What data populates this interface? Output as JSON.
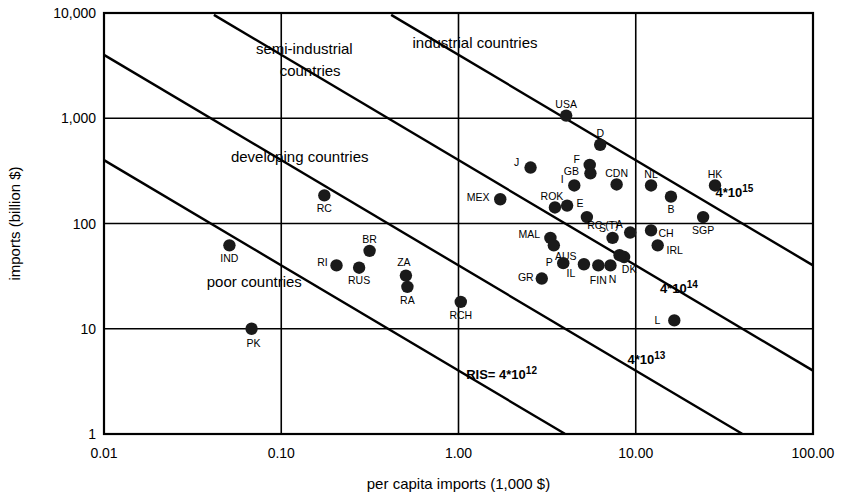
{
  "chart_data": {
    "type": "scatter",
    "title": "",
    "xlabel": "per capita imports (1,000 $)",
    "ylabel": "imports (billion $)",
    "xscale": "log",
    "yscale": "log",
    "xlim": [
      0.01,
      100.0
    ],
    "ylim": [
      1,
      10000
    ],
    "xticks": [
      "0.01",
      "0.10",
      "1.00",
      "10.00",
      "100.00"
    ],
    "xtick_values": [
      0.01,
      0.1,
      1.0,
      10.0,
      100.0
    ],
    "yticks": [
      "10,000",
      "1,000",
      "100",
      "10",
      "1"
    ],
    "ytick_values": [
      10000,
      1000,
      100,
      10,
      1
    ],
    "grid": true,
    "legend": "none",
    "region_labels": [
      {
        "text": "semi-industrial",
        "x": 0.072,
        "y": 4100
      },
      {
        "text": "countries",
        "x": 0.098,
        "y": 2500
      },
      {
        "text": "industrial countries",
        "x": 0.55,
        "y": 4700
      },
      {
        "text": "developing countries",
        "x": 0.052,
        "y": 380
      },
      {
        "text": "poor countries",
        "x": 0.038,
        "y": 25
      }
    ],
    "isolines": [
      {
        "label": "RIS= 4*10",
        "exponent": "12",
        "value": 4000000000000.0,
        "label_x": 1.75,
        "label_y": 3.3
      },
      {
        "label": "4*10",
        "exponent": "13",
        "value": 40000000000000.0,
        "label_x": 11.5,
        "label_y": 4.6
      },
      {
        "label": "4*10",
        "exponent": "14",
        "value": 400000000000000.0,
        "label_x": 17.5,
        "label_y": 22
      },
      {
        "label": "4*10",
        "exponent": "15",
        "value": 4000000000000000.0,
        "label_x": 36.0,
        "label_y": 180
      }
    ],
    "points": [
      {
        "code": "USA",
        "x": 4.05,
        "y": 1060,
        "lx": 0,
        "ly": -11
      },
      {
        "code": "D",
        "x": 6.3,
        "y": 560,
        "lx": 0,
        "ly": -11
      },
      {
        "code": "F",
        "x": 5.5,
        "y": 360,
        "lx": -13,
        "ly": -5
      },
      {
        "code": "J",
        "x": 2.55,
        "y": 340,
        "lx": -14,
        "ly": -5
      },
      {
        "code": "GB",
        "x": 5.55,
        "y": 300,
        "lx": -19,
        "ly": -2
      },
      {
        "code": "I",
        "x": 4.5,
        "y": 230,
        "lx": -12,
        "ly": -6
      },
      {
        "code": "CDN",
        "x": 7.8,
        "y": 235,
        "lx": 0,
        "ly": -11
      },
      {
        "code": "NL",
        "x": 12.2,
        "y": 230,
        "lx": 0,
        "ly": -11
      },
      {
        "code": "HK",
        "x": 28.0,
        "y": 230,
        "lx": 0,
        "ly": -11
      },
      {
        "code": "B",
        "x": 15.8,
        "y": 180,
        "lx": 0,
        "ly": 13
      },
      {
        "code": "MEX",
        "x": 1.72,
        "y": 170,
        "lx": -22,
        "ly": -2
      },
      {
        "code": "ROK",
        "x": 3.5,
        "y": 142,
        "lx": -3,
        "ly": -11
      },
      {
        "code": "E",
        "x": 4.1,
        "y": 148,
        "lx": 13,
        "ly": -2
      },
      {
        "code": "RC (T)",
        "x": 5.3,
        "y": 115,
        "lx": 16,
        "ly": 8
      },
      {
        "code": "RC",
        "x": 0.175,
        "y": 185,
        "lx": 0,
        "ly": 13
      },
      {
        "code": "SGP",
        "x": 24.0,
        "y": 115,
        "lx": 0,
        "ly": 13
      },
      {
        "code": "CH",
        "x": 12.2,
        "y": 86,
        "lx": 15,
        "ly": 3
      },
      {
        "code": "A",
        "x": 9.3,
        "y": 82,
        "lx": -11,
        "ly": -8
      },
      {
        "code": "S",
        "x": 7.4,
        "y": 73,
        "lx": -10,
        "ly": -9
      },
      {
        "code": "MAL",
        "x": 3.3,
        "y": 73,
        "lx": -21,
        "ly": -3
      },
      {
        "code": "AUS",
        "x": 3.45,
        "y": 62,
        "lx": 12,
        "ly": 11
      },
      {
        "code": "IRL",
        "x": 13.3,
        "y": 62,
        "lx": 17,
        "ly": 5
      },
      {
        "code": "BR",
        "x": 0.315,
        "y": 55,
        "lx": 0,
        "ly": -11
      },
      {
        "code": "IND",
        "x": 0.051,
        "y": 62,
        "lx": 0,
        "ly": 13
      },
      {
        "code": "DK",
        "x": 8.6,
        "y": 48,
        "lx": 5,
        "ly": 12
      },
      {
        "code": "A2",
        "x": 8.1,
        "y": 50,
        "lx": 0,
        "ly": 0
      },
      {
        "code": "N",
        "x": 7.2,
        "y": 40,
        "lx": 2,
        "ly": 14
      },
      {
        "code": "FIN",
        "x": 6.15,
        "y": 40,
        "lx": 0,
        "ly": 15
      },
      {
        "code": "IL",
        "x": 5.1,
        "y": 41,
        "lx": -13,
        "ly": 9
      },
      {
        "code": "P",
        "x": 3.9,
        "y": 42,
        "lx": -14,
        "ly": -1
      },
      {
        "code": "RI",
        "x": 0.205,
        "y": 40,
        "lx": -14,
        "ly": -3
      },
      {
        "code": "RUS",
        "x": 0.275,
        "y": 38,
        "lx": 0,
        "ly": 13
      },
      {
        "code": "GR",
        "x": 2.95,
        "y": 30,
        "lx": -16,
        "ly": -1
      },
      {
        "code": "ZA",
        "x": 0.505,
        "y": 32,
        "lx": -2,
        "ly": -13
      },
      {
        "code": "RA",
        "x": 0.515,
        "y": 25,
        "lx": 0,
        "ly": 14
      },
      {
        "code": "RCH",
        "x": 1.03,
        "y": 18,
        "lx": 0,
        "ly": 14
      },
      {
        "code": "L",
        "x": 16.5,
        "y": 12,
        "lx": -17,
        "ly": 0
      },
      {
        "code": "PK",
        "x": 0.068,
        "y": 10,
        "lx": 2,
        "ly": 15
      }
    ]
  }
}
